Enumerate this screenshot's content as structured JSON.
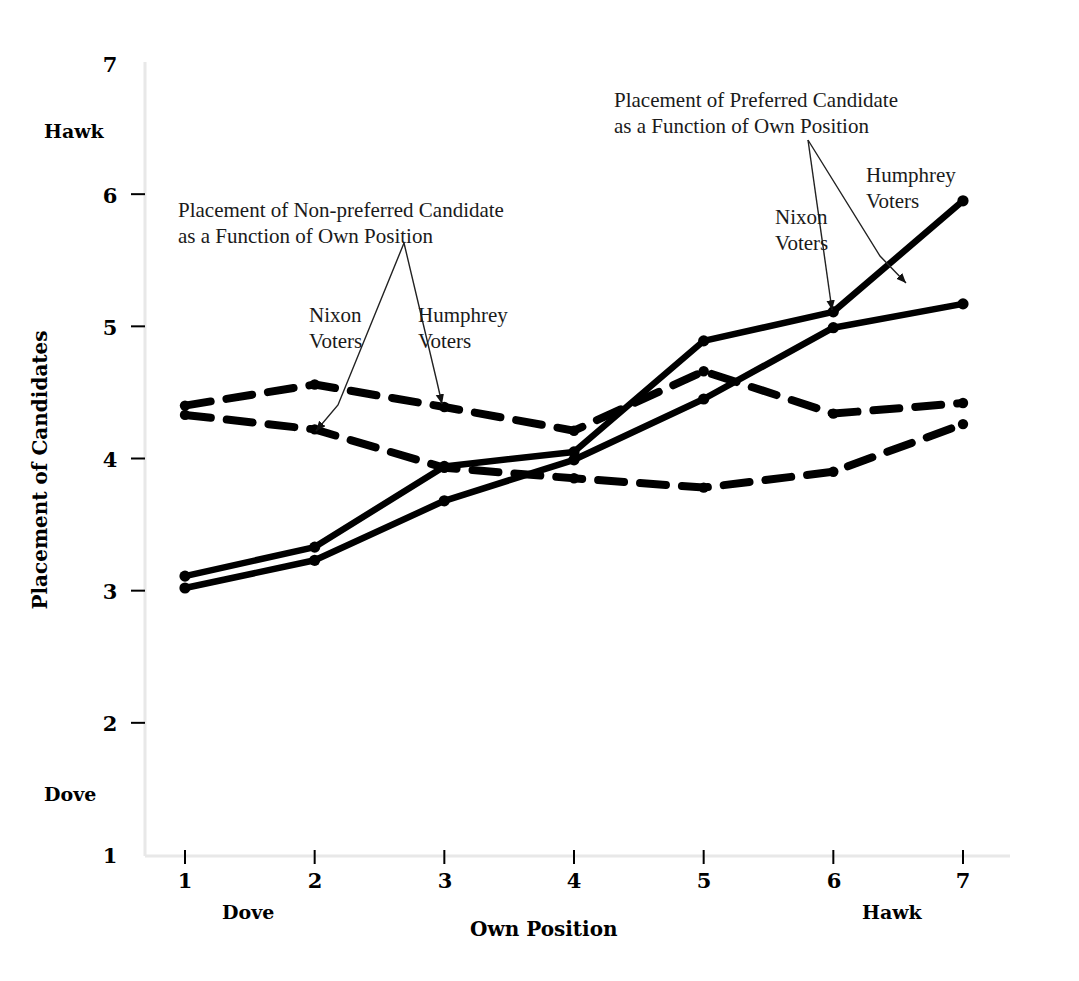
{
  "figure": {
    "background": "#ffffff",
    "ink": "#000000"
  },
  "axes": {
    "y": {
      "title": "Placement of Candidates",
      "ticks": [
        "1",
        "2",
        "3",
        "4",
        "5",
        "6",
        "7"
      ],
      "range": [
        1,
        7
      ],
      "pole_high": "Hawk",
      "pole_low": "Dove",
      "pole_high_value": 6.52,
      "pole_low_value": 1.52
    },
    "x": {
      "title": "Own Position",
      "ticks": [
        "1",
        "2",
        "3",
        "4",
        "5",
        "6",
        "7"
      ],
      "range": [
        1,
        7
      ],
      "pole_low": "Dove",
      "pole_high": "Hawk",
      "pole_low_value": 1.5,
      "pole_high_value": 6.4
    },
    "grid": false,
    "legend": "annotated-callouts"
  },
  "annotations": [
    {
      "id": "non-preferred",
      "text": "Placement of Non-preferred Candidate\nas a Function of Own Position",
      "x": 178,
      "y": 198
    },
    {
      "id": "preferred",
      "text": "Placement of Preferred Candidate\nas a Function of Own Position",
      "x": 614,
      "y": 88
    },
    {
      "id": "nixon-voters-left",
      "text": "Nixon\nVoters",
      "x": 309,
      "y": 303
    },
    {
      "id": "humphrey-voters-left",
      "text": "Humphrey\nVoters",
      "x": 418,
      "y": 303
    },
    {
      "id": "nixon-voters-right",
      "text": "Nixon\nVoters",
      "x": 775,
      "y": 205
    },
    {
      "id": "humphrey-voters-right",
      "text": "Humphrey\nVoters",
      "x": 866,
      "y": 163
    }
  ],
  "chart_data": {
    "type": "line",
    "title": "",
    "xlabel": "Own Position",
    "ylabel": "Placement of Candidates",
    "xlim": [
      1,
      7
    ],
    "ylim": [
      1,
      7
    ],
    "x": [
      1,
      2,
      3,
      4,
      5,
      6,
      7
    ],
    "grid": false,
    "series": [
      {
        "name": "Humphrey Voters — Preferred Candidate",
        "style": "solid",
        "marker": "dot",
        "values": [
          3.11,
          3.33,
          3.94,
          4.05,
          4.89,
          5.11,
          5.95
        ]
      },
      {
        "name": "Nixon Voters — Preferred Candidate",
        "style": "solid",
        "marker": "dot",
        "values": [
          3.02,
          3.23,
          3.68,
          3.99,
          4.45,
          4.99,
          5.17
        ]
      },
      {
        "name": "Nixon Voters — Non-preferred Candidate",
        "style": "dashed",
        "marker": "dot",
        "values": [
          4.4,
          4.56,
          4.39,
          4.21,
          4.66,
          4.34,
          4.42
        ]
      },
      {
        "name": "Humphrey Voters — Non-preferred Candidate",
        "style": "dashed",
        "marker": "dot",
        "values": [
          4.33,
          4.22,
          3.93,
          3.85,
          3.78,
          3.9,
          4.26
        ]
      }
    ]
  }
}
